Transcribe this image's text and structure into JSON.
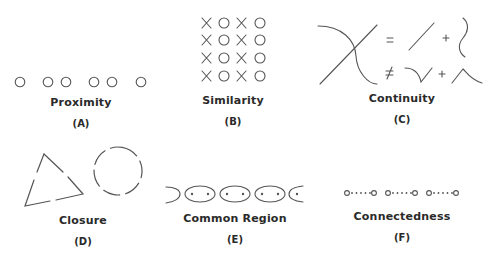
{
  "colors": {
    "stroke": "#555555",
    "text": "#2a2a2a",
    "background": "#ffffff"
  },
  "panels": [
    {
      "id": "A",
      "name": "Proximity",
      "tag": "(A)",
      "description": "Six circles grouped by spacing: 1, 2, 2, 1"
    },
    {
      "id": "B",
      "name": "Similarity",
      "tag": "(B)",
      "description": "4x4 grid of alternating columns X O X O",
      "grid": [
        [
          "X",
          "O",
          "X",
          "O"
        ],
        [
          "X",
          "O",
          "X",
          "O"
        ],
        [
          "X",
          "O",
          "X",
          "O"
        ],
        [
          "X",
          "O",
          "X",
          "O"
        ]
      ]
    },
    {
      "id": "C",
      "name": "Continuity",
      "tag": "(C)",
      "description": "Crossing line and curve = line + curve, not equal to V-shape + arch",
      "symbols": {
        "equals": "=",
        "not_equals": "≠",
        "plus": "+"
      }
    },
    {
      "id": "D",
      "name": "Closure",
      "tag": "(D)",
      "description": "Broken triangle and broken circle perceived as whole shapes"
    },
    {
      "id": "E",
      "name": "Common Region",
      "tag": "(E)",
      "description": "Chain of ellipses each enclosing two dots"
    },
    {
      "id": "F",
      "name": "Connectedness",
      "tag": "(F)",
      "description": "Three pairs of circles connected by dotted lines"
    }
  ]
}
